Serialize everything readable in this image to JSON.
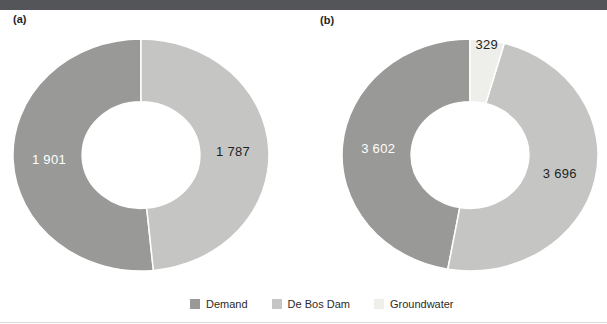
{
  "page": {
    "topbar_color": "#545559",
    "background": "#ffffff"
  },
  "palette": {
    "demand": "#999a98",
    "de_bos_dam": "#c5c6c4",
    "groundwater": "#eeefeb",
    "label_on_dark": "#ffffff",
    "label_on_light": "#1f1f1f"
  },
  "chart_data": [
    {
      "type": "pie",
      "subtype": "donut",
      "title": "(a)",
      "categories": [
        "Demand",
        "De Bos Dam"
      ],
      "values": [
        1901,
        1787
      ],
      "display_values": [
        "1 901",
        "1 787"
      ],
      "colors": [
        "#999a98",
        "#c5c6c4"
      ],
      "value_label_colors": [
        "#ffffff",
        "#1f1f1f"
      ],
      "direction": "counterclockwise-from-top",
      "legend_position": "bottom-shared"
    },
    {
      "type": "pie",
      "subtype": "donut",
      "title": "(b)",
      "categories": [
        "Demand",
        "De Bos Dam",
        "Groundwater"
      ],
      "values": [
        3602,
        3696,
        329
      ],
      "display_values": [
        "3 602",
        "3 696",
        "329"
      ],
      "colors": [
        "#999a98",
        "#c5c6c4",
        "#eeefeb"
      ],
      "value_label_colors": [
        "#ffffff",
        "#1f1f1f",
        "#1f1f1f"
      ],
      "direction": "counterclockwise-from-top",
      "legend_position": "bottom-shared"
    }
  ],
  "legend": {
    "items": [
      {
        "label": "Demand",
        "color": "#999a98"
      },
      {
        "label": "De Bos Dam",
        "color": "#c5c6c4"
      },
      {
        "label": "Groundwater",
        "color": "#eeefeb"
      }
    ]
  }
}
